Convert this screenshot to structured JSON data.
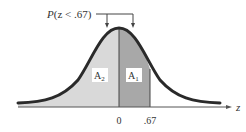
{
  "figure": {
    "title_label": "P(z < .67)",
    "title_prefix": "P",
    "title_rest": "(z < .67)",
    "region_left_label": "A",
    "region_left_sub": "2",
    "region_right_label": "A",
    "region_right_sub": "1",
    "axis_label": "z",
    "tick_zero": "0",
    "tick_value": ".67",
    "colors": {
      "curve": "#2a2a2a",
      "region_left": "#d9d9d9",
      "region_right": "#a8a8a8",
      "axis": "#555555",
      "label_box": "#ffffff"
    }
  }
}
